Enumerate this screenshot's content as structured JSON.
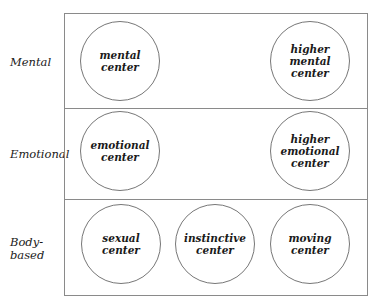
{
  "rows": [
    {
      "label": "Mental"
    },
    {
      "label": "Emotional"
    },
    {
      "label": "Body-\nbased"
    }
  ],
  "circles": {
    "mental": "mental\ncenter",
    "higher_mental": "higher\nmental\ncenter",
    "emotional": "emotional\ncenter",
    "higher_emotional": "higher\nemotional\ncenter",
    "sexual": "sexual\ncenter",
    "instinctive": "instinctive\ncenter",
    "moving": "moving\ncenter"
  }
}
